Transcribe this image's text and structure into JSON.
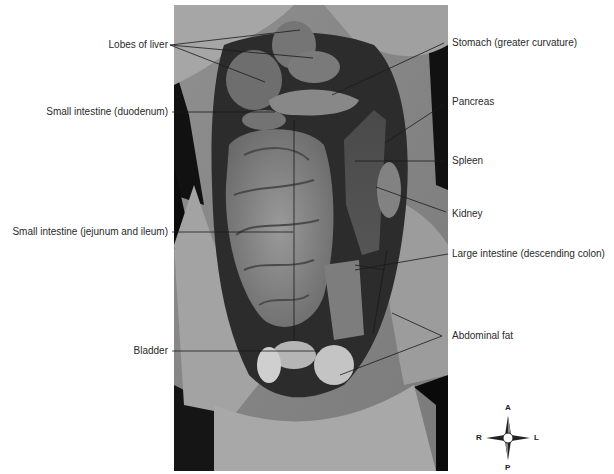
{
  "figure": {
    "labels_left": [
      {
        "id": "lobes-of-liver",
        "text": "Lobes of liver"
      },
      {
        "id": "small-intestine-duodenum",
        "text": "Small intestine (duodenum)"
      },
      {
        "id": "small-intestine-jejunum-ileum",
        "text": "Small intestine (jejunum and ileum)"
      },
      {
        "id": "bladder",
        "text": "Bladder"
      }
    ],
    "labels_right": [
      {
        "id": "stomach",
        "text": "Stomach (greater curvature)"
      },
      {
        "id": "pancreas",
        "text": "Pancreas"
      },
      {
        "id": "spleen",
        "text": "Spleen"
      },
      {
        "id": "kidney",
        "text": "Kidney"
      },
      {
        "id": "large-intestine",
        "text": "Large intestine (descending colon)"
      },
      {
        "id": "abdominal-fat",
        "text": "Abdominal fat"
      }
    ],
    "compass": {
      "anterior": "A",
      "posterior": "P",
      "right": "R",
      "left": "L"
    }
  }
}
